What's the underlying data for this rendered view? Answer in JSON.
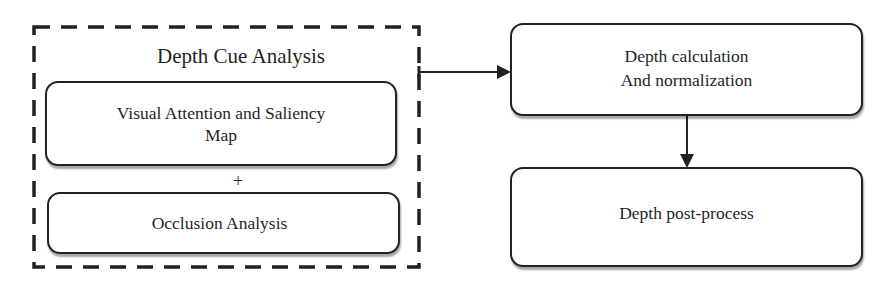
{
  "diagram": {
    "type": "flowchart",
    "group": {
      "id": "depth-cue-analysis",
      "title": "Depth Cue Analysis",
      "border_style": "dashed",
      "components": [
        {
          "id": "saliency",
          "lines": [
            "Visual Attention and Saliency",
            "Map"
          ]
        },
        {
          "id": "occlusion",
          "lines": [
            "Occlusion Analysis"
          ]
        }
      ],
      "combine_symbol": "+"
    },
    "nodes": [
      {
        "id": "depth-calc",
        "lines": [
          "Depth calculation",
          "And normalization"
        ]
      },
      {
        "id": "post-process",
        "lines": [
          "Depth post-process"
        ]
      }
    ],
    "edges": [
      {
        "from": "depth-cue-analysis",
        "to": "depth-calc",
        "direction": "right"
      },
      {
        "from": "depth-calc",
        "to": "post-process",
        "direction": "down"
      }
    ],
    "colors": {
      "stroke": "#222222",
      "background": "#ffffff",
      "text": "#1f1f1f"
    }
  }
}
